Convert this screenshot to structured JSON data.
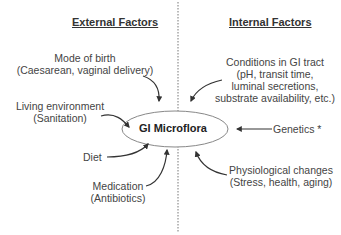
{
  "diagram": {
    "headings": {
      "external": "External Factors",
      "internal": "Internal Factors"
    },
    "center": "GI Microflora",
    "external_factors": [
      {
        "line1": "Mode of birth",
        "line2": "(Caesarean, vaginal delivery)"
      },
      {
        "line1": "Living environment",
        "line2": "(Sanitation)"
      },
      {
        "line1": "Diet"
      },
      {
        "line1": "Medication",
        "line2": "(Antibiotics)"
      }
    ],
    "internal_factors": [
      {
        "line1": "Conditions in GI tract",
        "line2": "(pH, transit time,",
        "line3": "luminal secretions,",
        "line4": "substrate availability, etc.)"
      },
      {
        "line1": "Genetics *"
      },
      {
        "line1": "Physiological changes",
        "line2": "(Stress, health, aging)"
      }
    ]
  }
}
